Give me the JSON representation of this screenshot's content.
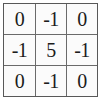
{
  "matrix": {
    "name": "sharpen-kernel",
    "rows": 3,
    "cols": 3,
    "cells": [
      [
        {
          "value": "0"
        },
        {
          "value": "-1"
        },
        {
          "value": "0"
        }
      ],
      [
        {
          "value": "-1"
        },
        {
          "value": "5"
        },
        {
          "value": "-1"
        }
      ],
      [
        {
          "value": "0"
        },
        {
          "value": "-1"
        },
        {
          "value": "0"
        }
      ]
    ],
    "colors": {
      "border": "#585858",
      "grid_line": "#6a6a6a",
      "cell_background": "#fbfbfb",
      "page_background": "#ffffff",
      "text": "#1c1c1c"
    }
  }
}
